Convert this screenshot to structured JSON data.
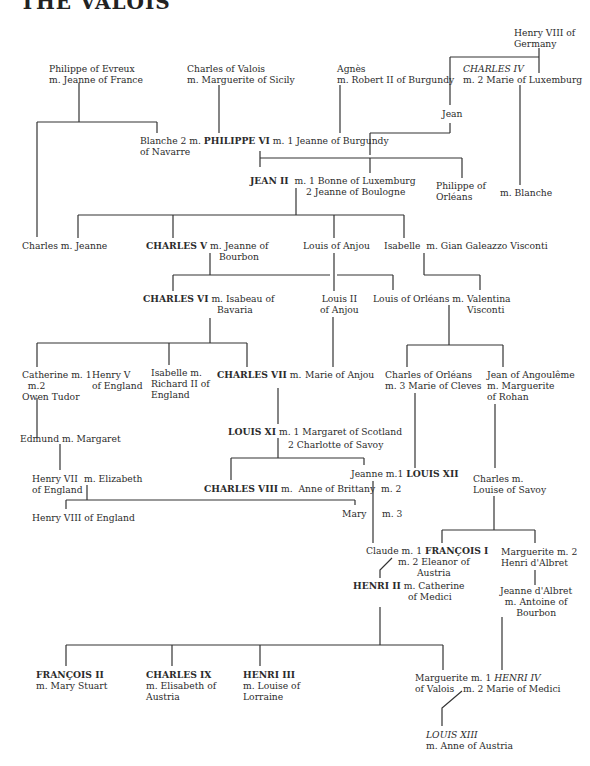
{
  "title": "THE VALOIS",
  "nodes": {
    "philippe_evreux": [
      "Philippe of Evreux",
      "m. Jeanne of France"
    ],
    "charles_valois": [
      "Charles of Valois",
      "m. Marguerite of Sicily"
    ],
    "agnes": [
      "Agnès",
      "m. Robert II of Burgundy"
    ],
    "henry_viii_germany": [
      "Henry VIII of",
      "Germany"
    ],
    "charles_iv": "CHARLES IV",
    "charles_iv_m": "m. 2 Marie of Luxemburg",
    "jean": "Jean",
    "blanche": [
      "Blanche 2 m.",
      "of Navarre"
    ],
    "philippe_vi": "PHILIPPE VI",
    "philippe_vi_m": "m. 1 Jeanne of Burgundy",
    "jean_ii": "JEAN II",
    "jean_ii_m": [
      "m. 1 Bonne of Luxemburg",
      "2 Jeanne of Boulogne"
    ],
    "philippe_orleans": [
      "Philippe of",
      "Orléans"
    ],
    "m_blanche": "m. Blanche",
    "charles_jeanne": "Charles m. Jeanne",
    "charles_v": "CHARLES V",
    "charles_v_m": [
      "m. Jeanne of",
      "Bourbon"
    ],
    "louis_anjou": "Louis of Anjou",
    "isabelle_visconti": "Isabelle  m. Gian Galeazzo Visconti",
    "charles_vi": "CHARLES VI",
    "charles_vi_m": [
      "m. Isabeau of",
      "Bavaria"
    ],
    "louis_ii_anjou": [
      "Louis II",
      "of Anjou"
    ],
    "louis_orleans": "Louis of Orléans m.",
    "valentina": [
      "Valentina",
      "Visconti"
    ],
    "catherine": [
      "Catherine m. 1",
      "m.2",
      "Owen Tudor"
    ],
    "henry_v": [
      "Henry V",
      "of England"
    ],
    "isabelle_richard": [
      "Isabelle m.",
      "Richard II of",
      "England"
    ],
    "charles_vii": "CHARLES VII",
    "charles_vii_m": "m.",
    "marie_anjou": "Marie of Anjou",
    "charles_orleans": [
      "Charles of Orléans",
      "m. 3 Marie of Cleves"
    ],
    "jean_angouleme": [
      "Jean of Angoulême",
      "m. Marguerite",
      "of Rohan"
    ],
    "edmund": "Edmund m. Margaret",
    "louis_xi": "LOUIS XI",
    "louis_xi_m": [
      "m. 1 Margaret of Scotland",
      "2 Charlotte of Savoy"
    ],
    "henry_vii": [
      "Henry VII",
      "of England"
    ],
    "m_elizabeth": "m. Elizabeth",
    "charles_viii": "CHARLES VIII",
    "charles_viii_m": "m.  Anne of Brittany",
    "jeanne_louis_xii_pre": "Jeanne m.1 ",
    "louis_xii": "LOUIS XII",
    "m2": "m. 2",
    "m3": "m. 3",
    "charles_louise": [
      "Charles m.",
      "Louise of Savoy"
    ],
    "henry_viii_england": "Henry VIII of England",
    "mary": "Mary",
    "claude_pre": "Claude m. 1 ",
    "francois_i": "FRANÇOIS I",
    "francois_i_m": [
      "m. 2 Eleanor of",
      "Austria"
    ],
    "marguerite_albret": [
      "Marguerite m. 2",
      "Henri d'Albret"
    ],
    "henri_ii": "HENRI II",
    "henri_ii_m": [
      "m. Catherine",
      "of Medici"
    ],
    "jeanne_albret": [
      "Jeanne d'Albret",
      "m. Antoine of",
      "Bourbon"
    ],
    "francois_ii": "FRANÇOIS II",
    "francois_ii_m": "m. Mary Stuart",
    "charles_ix": "CHARLES IX",
    "charles_ix_m": [
      "m. Elisabeth of",
      "Austria"
    ],
    "henri_iii": "HENRI III",
    "henri_iii_m": [
      "m. Louise of",
      "Lorraine"
    ],
    "marguerite_valois_pre": "Marguerite m. 1 ",
    "henri_iv": "HENRI IV",
    "marguerite_valois_line2": "of Valois   m. 2 Marie of Medici",
    "louis_xiii": "LOUIS XIII",
    "louis_xiii_m": "m. Anne of Austria"
  }
}
